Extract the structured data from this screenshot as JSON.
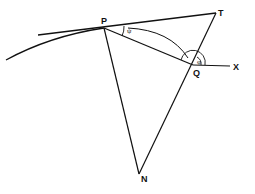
{
  "diagram": {
    "type": "geometry",
    "points": {
      "P": {
        "label": "P",
        "x": 104,
        "y": 28
      },
      "T": {
        "label": "T",
        "x": 216,
        "y": 13
      },
      "Q": {
        "label": "Q",
        "x": 193,
        "y": 65
      },
      "X": {
        "label": "X",
        "x": 232,
        "y": 66
      },
      "N": {
        "label": "N",
        "x": 140,
        "y": 175
      }
    },
    "angles": {
      "psi": {
        "label": "ψ",
        "at": "P"
      },
      "phi": {
        "label": "φ",
        "at": "Q"
      }
    },
    "segments": [
      "PT (tangent)",
      "PQ",
      "QX",
      "PN",
      "NT",
      "arc PQ"
    ],
    "colors": {
      "stroke": "#111111",
      "background": "#ffffff"
    }
  }
}
